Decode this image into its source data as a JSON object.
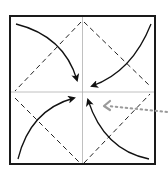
{
  "diagram": {
    "type": "origami-fold-step",
    "colors": {
      "background": "#ffffff",
      "paper_outline": "#1a1a1a",
      "crease_line": "#b0b0b0",
      "valley_fold": "#222222",
      "fold_arrow": "#111111",
      "reference_arrow": "#9a9a9a"
    },
    "paper": {
      "x": 10,
      "y": 16,
      "size": 145
    },
    "creases": [
      {
        "name": "vertical-crease",
        "x1": 82.5,
        "y1": 16,
        "x2": 82.5,
        "y2": 164
      },
      {
        "name": "horizontal-crease",
        "x1": 10,
        "y1": 92,
        "x2": 155,
        "y2": 92
      }
    ],
    "valley_folds": [
      {
        "name": "valley-fold-top-left",
        "x1": 82.5,
        "y1": 21,
        "x2": 15,
        "y2": 91
      },
      {
        "name": "valley-fold-top-right",
        "x1": 84,
        "y1": 21,
        "x2": 150,
        "y2": 86
      },
      {
        "name": "valley-fold-bottom-left",
        "x1": 15,
        "y1": 98,
        "x2": 80,
        "y2": 163
      },
      {
        "name": "valley-fold-bottom-right",
        "x1": 84,
        "y1": 163,
        "x2": 150,
        "y2": 93
      }
    ],
    "fold_arrows": [
      {
        "name": "arrow-top-left-corner",
        "d": "M16,24 Q64,36 77,80"
      },
      {
        "name": "arrow-top-right-corner",
        "d": "M151,24 Q132,72 92,86"
      },
      {
        "name": "arrow-bottom-left-corner",
        "d": "M18,159 Q30,110 74,98"
      },
      {
        "name": "arrow-bottom-right-corner",
        "d": "M149,159 Q104,150 88,100"
      }
    ],
    "reference_arrow": {
      "name": "dotted-pointer-to-center",
      "from": {
        "x": 168,
        "y": 112
      },
      "to": {
        "x": 104,
        "y": 106
      }
    }
  }
}
